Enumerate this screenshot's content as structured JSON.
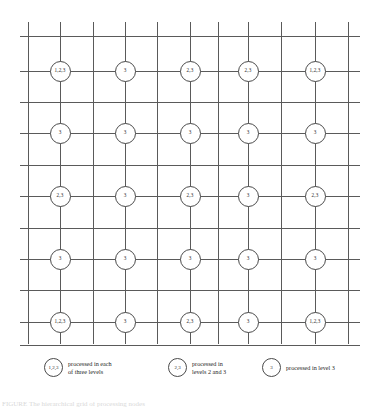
{
  "figure": {
    "bottom_caption_partial": "FIGURE  The hierarchical grid of processing nodes"
  },
  "grid": {
    "line_color": "#5a5a5a",
    "node_fill": "#ffffff",
    "node_stroke": "#4a4a4a",
    "columns": 5,
    "rows": 5,
    "vertical_lines": 11,
    "horizontal_lines": 11,
    "nodes": [
      [
        {
          "label": "1,2,3"
        },
        {
          "label": "3"
        },
        {
          "label": "2,3"
        },
        {
          "label": "2,3"
        },
        {
          "label": "1,2,3"
        }
      ],
      [
        {
          "label": "3"
        },
        {
          "label": "3"
        },
        {
          "label": "3"
        },
        {
          "label": "3"
        },
        {
          "label": "3"
        }
      ],
      [
        {
          "label": "2,3"
        },
        {
          "label": "3"
        },
        {
          "label": "2,3"
        },
        {
          "label": "3"
        },
        {
          "label": "2,3"
        }
      ],
      [
        {
          "label": "3"
        },
        {
          "label": "3"
        },
        {
          "label": "3"
        },
        {
          "label": "3"
        },
        {
          "label": "3"
        }
      ],
      [
        {
          "label": "1,2,3"
        },
        {
          "label": "3"
        },
        {
          "label": "2,3"
        },
        {
          "label": "3"
        },
        {
          "label": "1,2,3"
        }
      ]
    ]
  },
  "legend": {
    "items": [
      {
        "key": "1,2,3",
        "text": "processed in each\nof three levels"
      },
      {
        "key": "2,3",
        "text": "processed in\nlevels 2 and 3"
      },
      {
        "key": "3",
        "text": "processed in level 3"
      }
    ]
  }
}
